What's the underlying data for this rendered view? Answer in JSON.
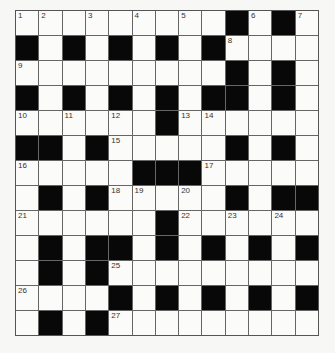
{
  "puzzle": {
    "rows": 13,
    "cols": 13,
    "grid": [
      "WWWWWWWWWBWBW",
      "BWBWBWBWBWWWW",
      "WWWWWWWWWBWBW",
      "BWBWBWBWBBWBW",
      "WWWWWWBWWWWWW",
      "BBWBWWWWWBWBW",
      "WWWWWBBBWWWWW",
      "WBWBWWWWWBWBB",
      "WWWWWWBWWWWWW",
      "WBWBBWBWBWBWB",
      "WBWBWWWWWWWWW",
      "WWWWBWBWBWBWB",
      "WBWBWWWWWWWWW"
    ],
    "numbers": [
      {
        "n": "1",
        "r": 0,
        "c": 0
      },
      {
        "n": "2",
        "r": 0,
        "c": 1
      },
      {
        "n": "3",
        "r": 0,
        "c": 3
      },
      {
        "n": "4",
        "r": 0,
        "c": 5
      },
      {
        "n": "5",
        "r": 0,
        "c": 7
      },
      {
        "n": "6",
        "r": 0,
        "c": 10
      },
      {
        "n": "7",
        "r": 0,
        "c": 12
      },
      {
        "n": "8",
        "r": 1,
        "c": 9
      },
      {
        "n": "9",
        "r": 2,
        "c": 0
      },
      {
        "n": "10",
        "r": 4,
        "c": 0
      },
      {
        "n": "11",
        "r": 4,
        "c": 2
      },
      {
        "n": "12",
        "r": 4,
        "c": 4
      },
      {
        "n": "13",
        "r": 4,
        "c": 7
      },
      {
        "n": "14",
        "r": 4,
        "c": 8
      },
      {
        "n": "15",
        "r": 5,
        "c": 4
      },
      {
        "n": "16",
        "r": 6,
        "c": 0
      },
      {
        "n": "17",
        "r": 6,
        "c": 8
      },
      {
        "n": "18",
        "r": 7,
        "c": 4
      },
      {
        "n": "19",
        "r": 7,
        "c": 5
      },
      {
        "n": "20",
        "r": 7,
        "c": 7
      },
      {
        "n": "21",
        "r": 8,
        "c": 0
      },
      {
        "n": "22",
        "r": 8,
        "c": 7
      },
      {
        "n": "23",
        "r": 8,
        "c": 9
      },
      {
        "n": "24",
        "r": 8,
        "c": 11
      },
      {
        "n": "25",
        "r": 10,
        "c": 4
      },
      {
        "n": "26",
        "r": 11,
        "c": 0
      },
      {
        "n": "27",
        "r": 12,
        "c": 4
      }
    ],
    "colors": {
      "block": "#080808",
      "cell": "#fbfbf9",
      "grid_line": "#666666",
      "number": "#333333"
    }
  }
}
